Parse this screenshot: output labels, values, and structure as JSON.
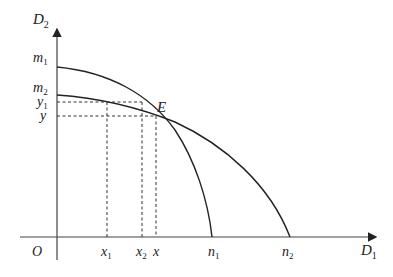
{
  "diagram": {
    "type": "production-possibility-frontiers",
    "axes": {
      "y_label": "D",
      "y_label_sub": "2",
      "x_label": "D",
      "x_label_sub": "1",
      "origin": "O"
    },
    "y_ticks": [
      {
        "id": "m1",
        "base": "m",
        "sub": "1"
      },
      {
        "id": "m2",
        "base": "m",
        "sub": "2"
      },
      {
        "id": "y1",
        "base": "y",
        "sub": "1"
      },
      {
        "id": "y",
        "base": "y",
        "sub": ""
      }
    ],
    "x_ticks": [
      {
        "id": "x1",
        "base": "x",
        "sub": "1"
      },
      {
        "id": "x2",
        "base": "x",
        "sub": "2"
      },
      {
        "id": "x",
        "base": "x",
        "sub": ""
      },
      {
        "id": "n1",
        "base": "n",
        "sub": "1"
      },
      {
        "id": "n2",
        "base": "n",
        "sub": "2"
      }
    ],
    "curves": [
      {
        "name": "m1-n1",
        "from": "m1",
        "to": "n1"
      },
      {
        "name": "m2-n2",
        "from": "m2",
        "to": "n2"
      }
    ],
    "intersection": {
      "label": "E"
    },
    "colors": {
      "line": "#222222",
      "dashed": "#333333"
    }
  }
}
